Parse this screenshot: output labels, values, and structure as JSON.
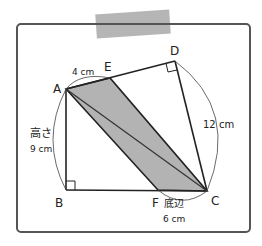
{
  "diagram": {
    "points": {
      "A": {
        "label": "A",
        "x": 66,
        "y": 89
      },
      "B": {
        "label": "B",
        "x": 66,
        "y": 190
      },
      "C": {
        "label": "C",
        "x": 207,
        "y": 191
      },
      "D": {
        "label": "D",
        "x": 175,
        "y": 61
      },
      "E": {
        "label": "E",
        "x": 110,
        "y": 78
      },
      "F": {
        "label": "F",
        "x": 158,
        "y": 190
      }
    },
    "measurements": {
      "ae": "4 cm",
      "dc": "12 cm",
      "height_label": "高さ",
      "height_value": "9 cm",
      "base_label": "底辺",
      "base_value": "6 cm"
    },
    "colors": {
      "shade": "#b3b3b3",
      "line": "#222222",
      "frame": "#555555",
      "tape": "#a8a8a8"
    }
  }
}
